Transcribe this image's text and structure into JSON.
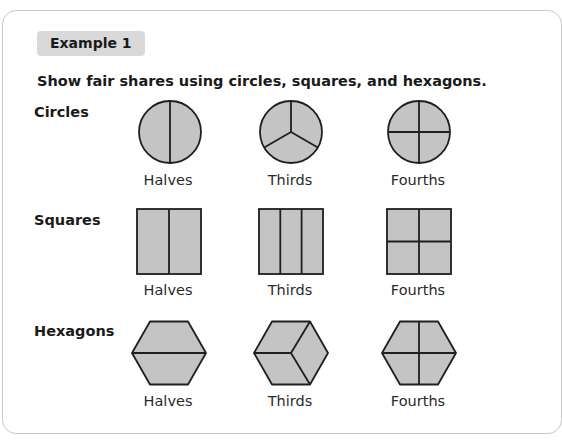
{
  "badge": "Example 1",
  "instruction": "Show fair shares using circles, squares, and hexagons.",
  "rows": [
    {
      "label": "Circles",
      "captions": [
        "Halves",
        "Thirds",
        "Fourths"
      ]
    },
    {
      "label": "Squares",
      "captions": [
        "Halves",
        "Thirds",
        "Fourths"
      ]
    },
    {
      "label": "Hexagons",
      "captions": [
        "Halves",
        "Thirds",
        "Fourths"
      ]
    }
  ],
  "colors": {
    "shape_fill": "#c4c4c4",
    "stroke": "#1f1f1f",
    "badge_bg": "#d9d9d9",
    "card_border": "#c8c8c8"
  }
}
